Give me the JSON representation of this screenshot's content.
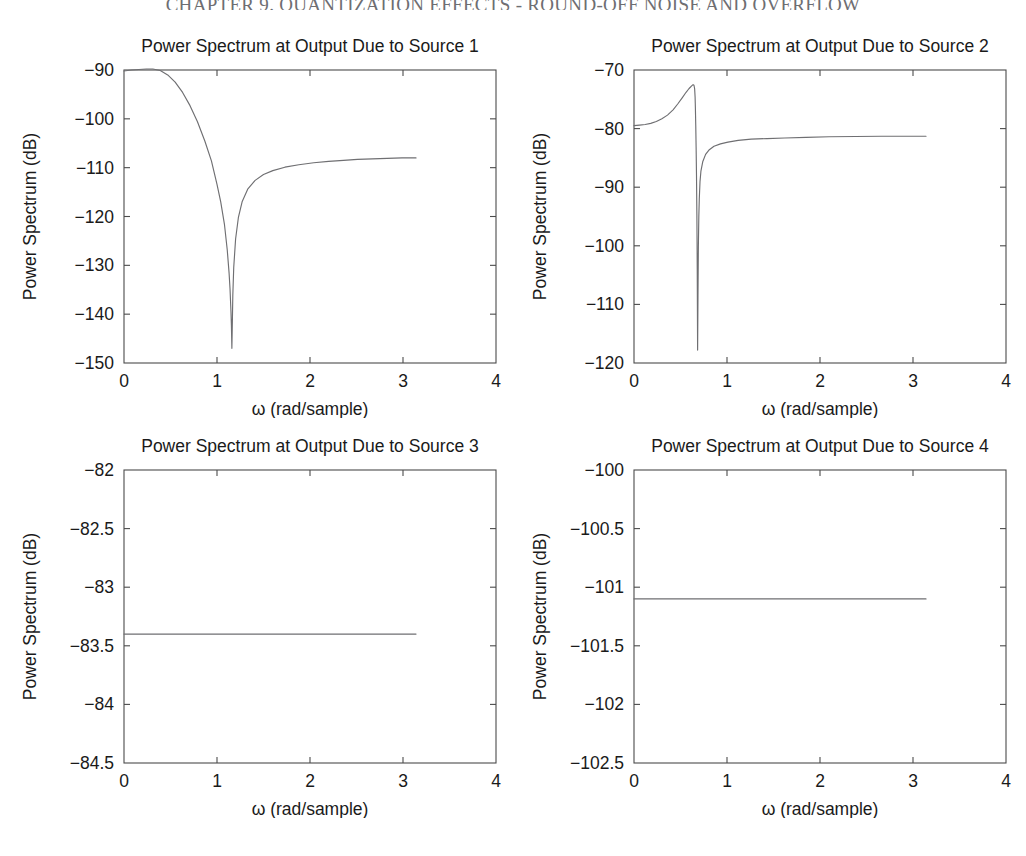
{
  "running_head": "CHAPTER 9. QUANTIZATION EFFECTS - ROUND-OFF NOISE AND OVERFLOW",
  "figure": {
    "panel_count": 4,
    "shared_xlabel": "ω (rad/sample)",
    "shared_ylabel": "Power Spectrum (dB)"
  },
  "chart_data": [
    {
      "type": "line",
      "title": "Power Spectrum at Output Due to Source 1",
      "xlabel": "ω (rad/sample)",
      "ylabel": "Power Spectrum (dB)",
      "xlim": [
        0,
        4
      ],
      "ylim": [
        -150,
        -90
      ],
      "xticks": [
        0,
        1,
        2,
        3,
        4
      ],
      "xticklabels": [
        "0",
        "1",
        "2",
        "3",
        "4"
      ],
      "yticks": [
        -150,
        -140,
        -130,
        -120,
        -110,
        -100,
        -90
      ],
      "yticklabels": [
        "-150",
        "-140",
        "-130",
        "-120",
        "-110",
        "-100",
        "-90"
      ],
      "grid": false,
      "legend": null,
      "series_name": "Source 1 output power spectrum",
      "x": [
        0.0,
        0.08,
        0.16,
        0.24,
        0.31,
        0.39,
        0.47,
        0.55,
        0.63,
        0.71,
        0.79,
        0.87,
        0.94,
        1.0,
        1.04,
        1.08,
        1.11,
        1.13,
        1.14,
        1.15,
        1.155,
        1.16,
        1.165,
        1.17,
        1.18,
        1.2,
        1.23,
        1.27,
        1.33,
        1.41,
        1.5,
        1.6,
        1.73,
        1.88,
        2.04,
        2.2,
        2.36,
        2.51,
        2.67,
        2.83,
        2.99,
        3.14
      ],
      "y": [
        -90.2,
        -90.0,
        -89.9,
        -89.8,
        -89.8,
        -90.1,
        -91.0,
        -92.5,
        -94.6,
        -97.3,
        -100.6,
        -104.6,
        -108.6,
        -113.4,
        -117.0,
        -121.6,
        -126.8,
        -131.6,
        -134.8,
        -139.4,
        -142.4,
        -147.0,
        -141.8,
        -136.2,
        -130.4,
        -124.6,
        -120.2,
        -117.0,
        -114.4,
        -112.6,
        -111.4,
        -110.6,
        -109.9,
        -109.4,
        -109.0,
        -108.7,
        -108.5,
        -108.3,
        -108.2,
        -108.1,
        -108.0,
        -108.0
      ]
    },
    {
      "type": "line",
      "title": "Power Spectrum at Output Due to Source 2",
      "xlabel": "ω (rad/sample)",
      "ylabel": "Power Spectrum (dB)",
      "xlim": [
        0,
        4
      ],
      "ylim": [
        -120,
        -70
      ],
      "xticks": [
        0,
        1,
        2,
        3,
        4
      ],
      "xticklabels": [
        "0",
        "1",
        "2",
        "3",
        "4"
      ],
      "yticks": [
        -120,
        -110,
        -100,
        -90,
        -80,
        -70
      ],
      "yticklabels": [
        "-120",
        "-110",
        "-100",
        "-90",
        "-80",
        "-70"
      ],
      "grid": false,
      "legend": null,
      "series_name": "Source 2 output power spectrum",
      "x": [
        0.0,
        0.06,
        0.12,
        0.18,
        0.24,
        0.3,
        0.36,
        0.42,
        0.47,
        0.52,
        0.56,
        0.59,
        0.62,
        0.635,
        0.645,
        0.652,
        0.657,
        0.66,
        0.664,
        0.668,
        0.672,
        0.676,
        0.68,
        0.684,
        0.688,
        0.692,
        0.697,
        0.702,
        0.71,
        0.72,
        0.74,
        0.77,
        0.81,
        0.86,
        0.93,
        1.01,
        1.12,
        1.26,
        1.43,
        1.62,
        1.85,
        2.1,
        2.38,
        2.66,
        2.92,
        3.14
      ],
      "y": [
        -79.5,
        -79.4,
        -79.3,
        -79.1,
        -78.8,
        -78.3,
        -77.7,
        -76.8,
        -75.8,
        -74.7,
        -73.8,
        -73.2,
        -72.7,
        -72.5,
        -72.6,
        -73.2,
        -74.6,
        -76.4,
        -79.4,
        -83.2,
        -88.0,
        -94.6,
        -104.0,
        -117.8,
        -108.4,
        -100.2,
        -95.0,
        -92.0,
        -89.0,
        -87.2,
        -85.6,
        -84.4,
        -83.6,
        -83.0,
        -82.6,
        -82.3,
        -82.0,
        -81.8,
        -81.7,
        -81.6,
        -81.5,
        -81.4,
        -81.35,
        -81.3,
        -81.3,
        -81.3
      ]
    },
    {
      "type": "line",
      "title": "Power Spectrum at Output Due to Source 3",
      "xlabel": "ω (rad/sample)",
      "ylabel": "Power Spectrum (dB)",
      "xlim": [
        0,
        4
      ],
      "ylim": [
        -84.5,
        -82
      ],
      "xticks": [
        0,
        1,
        2,
        3,
        4
      ],
      "xticklabels": [
        "0",
        "1",
        "2",
        "3",
        "4"
      ],
      "yticks": [
        -84.5,
        -84,
        -83.5,
        -83,
        -82.5,
        -82
      ],
      "yticklabels": [
        "-84.5",
        "-84",
        "-83.5",
        "-83",
        "-82.5",
        "-82"
      ],
      "grid": false,
      "legend": null,
      "series_name": "Source 3 output power spectrum",
      "x": [
        0.0,
        0.52,
        1.05,
        1.57,
        2.09,
        2.62,
        3.14
      ],
      "y": [
        -83.4,
        -83.4,
        -83.4,
        -83.4,
        -83.4,
        -83.4,
        -83.4
      ]
    },
    {
      "type": "line",
      "title": "Power Spectrum at Output Due to Source 4",
      "xlabel": "ω (rad/sample)",
      "ylabel": "Power Spectrum (dB)",
      "xlim": [
        0,
        4
      ],
      "ylim": [
        -102.5,
        -100
      ],
      "xticks": [
        0,
        1,
        2,
        3,
        4
      ],
      "xticklabels": [
        "0",
        "1",
        "2",
        "3",
        "4"
      ],
      "yticks": [
        -102.5,
        -102,
        -101.5,
        -101,
        -100.5,
        -100
      ],
      "yticklabels": [
        "-102.5",
        "-102",
        "-101.5",
        "-101",
        "-100.5",
        "-100"
      ],
      "grid": false,
      "legend": null,
      "series_name": "Source 4 output power spectrum",
      "x": [
        0.0,
        0.52,
        1.05,
        1.57,
        2.09,
        2.62,
        3.14
      ],
      "y": [
        -101.1,
        -101.1,
        -101.1,
        -101.1,
        -101.1,
        -101.1,
        -101.1
      ]
    }
  ],
  "colors": {
    "line": "#6f6f72",
    "axis": "#4b4b4b",
    "text": "#1a1a1a",
    "background": "#ffffff",
    "running_head": "#6e6e72"
  }
}
